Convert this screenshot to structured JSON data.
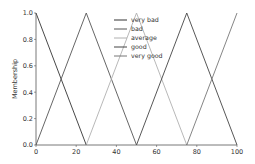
{
  "chart_data": {
    "type": "line",
    "title": "",
    "xlabel": "",
    "ylabel": "Membership",
    "xlim": [
      0,
      100
    ],
    "ylim": [
      0,
      1
    ],
    "x_ticks": [
      "0",
      "20",
      "40",
      "60",
      "80",
      "100"
    ],
    "y_ticks": [
      "0.0",
      "0.2",
      "0.4",
      "0.6",
      "0.8",
      "1.0"
    ],
    "grid": false,
    "legend_position": "upper center",
    "series": [
      {
        "name": "very bad",
        "color": "#333333",
        "x": [
          0,
          0,
          25
        ],
        "y": [
          1,
          1,
          0
        ]
      },
      {
        "name": "bad",
        "color": "#555555",
        "x": [
          0,
          25,
          50
        ],
        "y": [
          0,
          1,
          0
        ]
      },
      {
        "name": "average",
        "color": "#b0b0b0",
        "x": [
          25,
          50,
          75
        ],
        "y": [
          0,
          1,
          0
        ]
      },
      {
        "name": "good",
        "color": "#444444",
        "x": [
          50,
          75,
          100
        ],
        "y": [
          0,
          1,
          0
        ]
      },
      {
        "name": "very good",
        "color": "#777777",
        "x": [
          75,
          100,
          100
        ],
        "y": [
          0,
          1,
          1
        ]
      }
    ]
  }
}
